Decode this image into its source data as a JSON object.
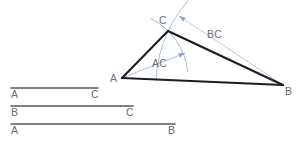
{
  "figure": {
    "kind": "geometry-construction",
    "colors": {
      "triangle_stroke": "#1c1c22",
      "construction_stroke": "#8ba8cc",
      "segment_stroke": "#55555c",
      "label_text": "#6b6b70",
      "background": "#ffffff"
    }
  },
  "triangle": {
    "vertices": [
      {
        "name": "A",
        "label": "A",
        "x": 122,
        "y": 78
      },
      {
        "name": "C",
        "label": "C",
        "x": 168,
        "y": 31
      },
      {
        "name": "B",
        "label": "B",
        "x": 283,
        "y": 85
      }
    ],
    "label_positions": [
      {
        "name": "A",
        "x": 110,
        "y": 82
      },
      {
        "name": "C",
        "x": 159,
        "y": 24
      },
      {
        "name": "B",
        "x": 285,
        "y": 95
      }
    ],
    "sides": [
      {
        "from": "A",
        "to": "C"
      },
      {
        "from": "C",
        "to": "B"
      },
      {
        "from": "A",
        "to": "B"
      }
    ]
  },
  "construction": {
    "arcs": [
      {
        "name": "arc-from-A",
        "center": "A",
        "radius": 66,
        "start_deg": -64,
        "end_deg": -6
      },
      {
        "name": "arc-from-B",
        "center": "B",
        "radius": 127,
        "start_deg": 182,
        "end_deg": 228
      }
    ],
    "radius_lines": [
      {
        "name": "radius-line-AC",
        "label": "AC",
        "from": "A",
        "to_x": 185,
        "to_y": 53,
        "label_x": 152,
        "label_y": 67
      },
      {
        "name": "radius-line-BC",
        "label": "BC",
        "from": "B",
        "to_x": 179,
        "to_y": 16,
        "label_x": 207,
        "label_y": 38
      }
    ]
  },
  "reference_segments": [
    {
      "name": "segment-AC",
      "left_label": "A",
      "right_label": "C",
      "x1": 11,
      "x2": 98,
      "y": 88,
      "length_px": 87,
      "label_y": 98
    },
    {
      "name": "segment-BC",
      "left_label": "B",
      "right_label": "C",
      "x1": 11,
      "x2": 133,
      "y": 106,
      "length_px": 122,
      "label_y": 116
    },
    {
      "name": "segment-AB",
      "left_label": "A",
      "right_label": "B",
      "x1": 11,
      "x2": 175,
      "y": 124,
      "length_px": 164,
      "label_y": 134
    }
  ]
}
